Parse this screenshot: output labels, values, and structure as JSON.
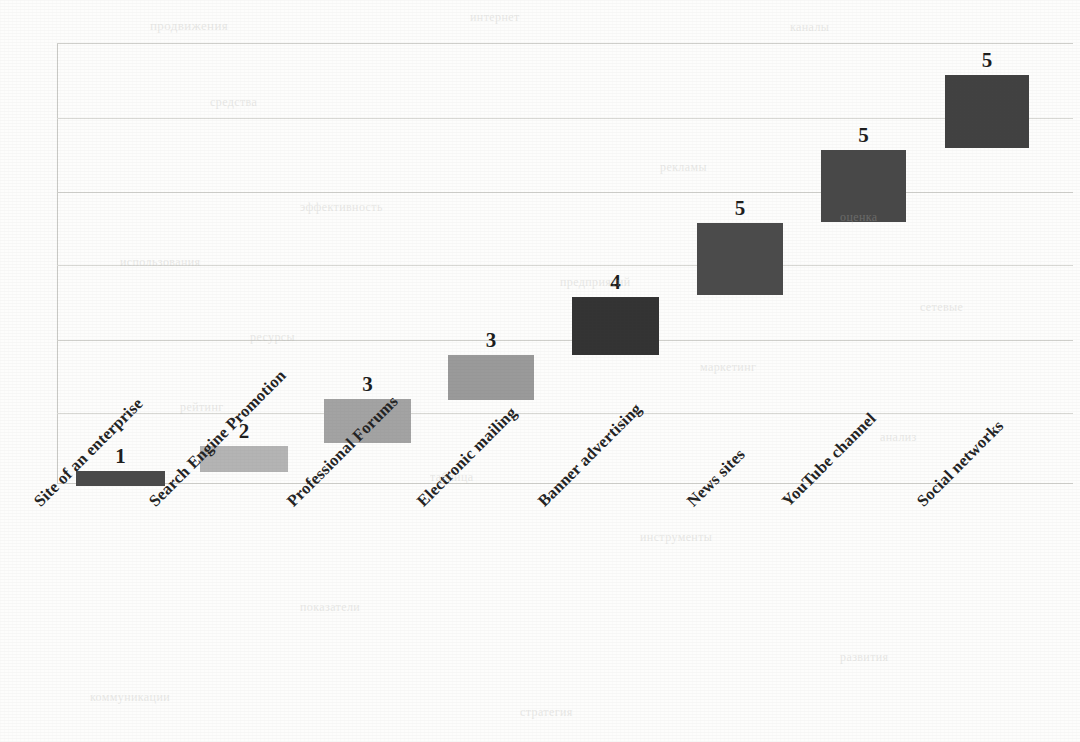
{
  "chart_data": {
    "type": "bar",
    "title": "",
    "subtitle": "",
    "xlabel": "",
    "ylabel": "",
    "categories": [
      "Site of an enterprise",
      "Search Engine Promotion",
      "Professional Forums",
      "Electronic mailing",
      "Banner advertising",
      "News sites",
      "YouTube channel",
      "Social networks"
    ],
    "values": [
      1,
      2,
      3,
      3,
      4,
      5,
      5,
      5
    ],
    "data_labels": [
      "1",
      "2",
      "3",
      "3",
      "4",
      "5",
      "5",
      "5"
    ],
    "bar_colors": [
      "#4a4a4a",
      "#b4b4b4",
      "#a3a3a3",
      "#9a9a9a",
      "#333333",
      "#4b4b4b",
      "#484848",
      "#414141"
    ],
    "stacked_waterfall": true,
    "cumulative_bottom": [
      0,
      1,
      2,
      3,
      4,
      5,
      6,
      7
    ],
    "ylim": [
      0,
      24
    ],
    "grid": true,
    "gridlines_count": 7,
    "legend": "none",
    "axis_color": "#c9c9c5",
    "grid_color": "#cfcfcb",
    "background": "#fdfdfc"
  },
  "bars": [
    {
      "label": "Site of an enterprise",
      "value": "1",
      "left": 76,
      "top": 471,
      "width": 89,
      "height": 15,
      "color": "#4a4a4a",
      "value_x": 76,
      "value_w": 89
    },
    {
      "label": "Search Engine Promotion",
      "value": "2",
      "left": 200,
      "top": 446,
      "width": 88,
      "height": 26,
      "color": "#b4b4b4",
      "value_x": 200,
      "value_w": 88
    },
    {
      "label": "Professional Forums",
      "value": "3",
      "left": 324,
      "top": 399,
      "width": 87,
      "height": 44,
      "color": "#a3a3a3",
      "value_x": 324,
      "value_w": 87
    },
    {
      "label": "Electronic mailing",
      "value": "3",
      "left": 448,
      "top": 355,
      "width": 86,
      "height": 45,
      "color": "#9a9a9a",
      "value_x": 448,
      "value_w": 86
    },
    {
      "label": "Banner advertising",
      "value": "4",
      "left": 572,
      "top": 297,
      "width": 87,
      "height": 58,
      "color": "#333333",
      "value_x": 572,
      "value_w": 87
    },
    {
      "label": "News sites",
      "value": "5",
      "left": 697,
      "top": 223,
      "width": 86,
      "height": 72,
      "color": "#4b4b4b",
      "value_x": 697,
      "value_w": 86
    },
    {
      "label": "YouTube channel",
      "value": "5",
      "left": 821,
      "top": 150,
      "width": 85,
      "height": 72,
      "color": "#484848",
      "value_x": 821,
      "value_w": 85
    },
    {
      "label": "Social networks",
      "value": "5",
      "left": 945,
      "top": 75,
      "width": 84,
      "height": 73,
      "color": "#414141",
      "value_x": 945,
      "value_w": 84
    }
  ],
  "x_axis_labels": [
    {
      "text": "Site of an enterprise",
      "x": 30,
      "y": 14
    },
    {
      "text": "Search Engine Promotion",
      "x": 145,
      "y": 14
    },
    {
      "text": "Professional Forums",
      "x": 283,
      "y": 14
    },
    {
      "text": "Electronic mailing",
      "x": 413,
      "y": 14
    },
    {
      "text": "Banner advertising",
      "x": 534,
      "y": 14
    },
    {
      "text": "News sites",
      "x": 683,
      "y": 14
    },
    {
      "text": "YouTube channel",
      "x": 778,
      "y": 14
    },
    {
      "text": "Social networks",
      "x": 913,
      "y": 14
    }
  ],
  "gridlines": [
    {
      "y": 0
    },
    {
      "y": 75
    },
    {
      "y": 149
    },
    {
      "y": 222
    },
    {
      "y": 297
    },
    {
      "y": 370
    },
    {
      "y": 440
    }
  ],
  "scan_artifacts": [
    {
      "text": "продвижения",
      "x": 150,
      "y": 18,
      "size": 13,
      "rot": 0
    },
    {
      "text": "интернет",
      "x": 470,
      "y": 10,
      "size": 12,
      "rot": 0
    },
    {
      "text": "каналы",
      "x": 790,
      "y": 20,
      "size": 12,
      "rot": 0
    },
    {
      "text": "средства",
      "x": 210,
      "y": 95,
      "size": 12,
      "rot": 0
    },
    {
      "text": "рекламы",
      "x": 660,
      "y": 160,
      "size": 12,
      "rot": 0
    },
    {
      "text": "эффективность",
      "x": 300,
      "y": 200,
      "size": 12,
      "rot": 0
    },
    {
      "text": "оценка",
      "x": 840,
      "y": 210,
      "size": 12,
      "rot": 0
    },
    {
      "text": "использования",
      "x": 120,
      "y": 255,
      "size": 12,
      "rot": 0
    },
    {
      "text": "предприятий",
      "x": 560,
      "y": 275,
      "size": 12,
      "rot": 0
    },
    {
      "text": "сетевые",
      "x": 920,
      "y": 300,
      "size": 12,
      "rot": 0
    },
    {
      "text": "ресурсы",
      "x": 250,
      "y": 330,
      "size": 12,
      "rot": 0
    },
    {
      "text": "маркетинг",
      "x": 700,
      "y": 360,
      "size": 12,
      "rot": 0
    },
    {
      "text": "рейтинг",
      "x": 180,
      "y": 400,
      "size": 12,
      "rot": 0
    },
    {
      "text": "анализ",
      "x": 880,
      "y": 430,
      "size": 12,
      "rot": 0
    },
    {
      "text": "таблица",
      "x": 430,
      "y": 470,
      "size": 12,
      "rot": 0
    },
    {
      "text": "инструменты",
      "x": 640,
      "y": 530,
      "size": 12,
      "rot": 0
    },
    {
      "text": "показатели",
      "x": 300,
      "y": 600,
      "size": 12,
      "rot": 0
    },
    {
      "text": "развития",
      "x": 840,
      "y": 650,
      "size": 12,
      "rot": 0
    },
    {
      "text": "коммуникации",
      "x": 90,
      "y": 690,
      "size": 12,
      "rot": 0
    },
    {
      "text": "стратегия",
      "x": 520,
      "y": 705,
      "size": 12,
      "rot": 0
    }
  ]
}
